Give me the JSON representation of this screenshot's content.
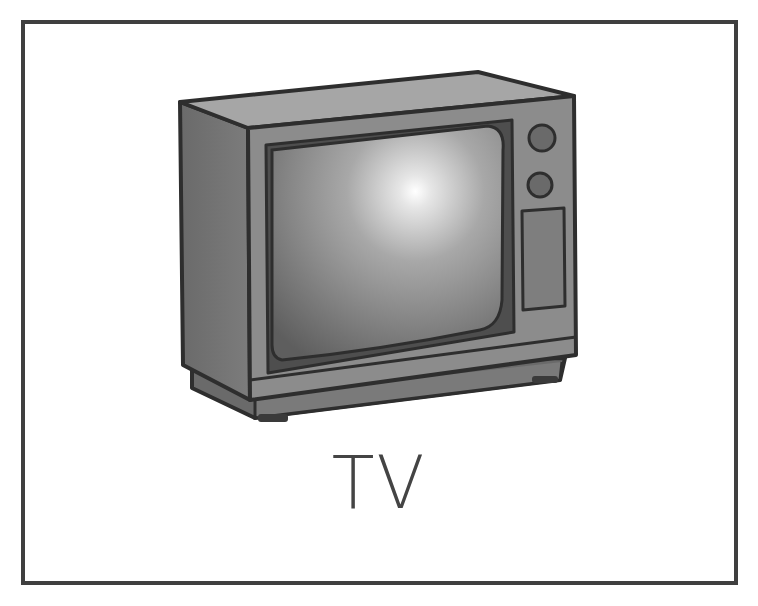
{
  "card": {
    "label": "TV",
    "image_subject": "tv-icon",
    "border_color": "#3f3f3f",
    "background_color": "#ffffff"
  },
  "illustration": {
    "body_color": "#8a8a8a",
    "side_color": "#6e6e6e",
    "top_color": "#a8a8a8",
    "outline_color": "#2e2e2e",
    "screen_color": "#7a7a7a",
    "screen_highlight": "#ffffff",
    "knob_count": 2,
    "panel_count": 1
  }
}
